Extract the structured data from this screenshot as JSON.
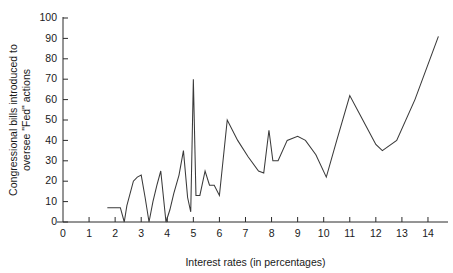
{
  "chart_data": {
    "type": "line",
    "title": "",
    "subtitle": "",
    "xlabel": "Interest rates (in percentages)",
    "ylabel": "Congressional bills introduced to oversee \"Fed\" actions",
    "ylabel_lines": [
      "Congressional bills introduced to",
      "oversee \"Fed\" actions"
    ],
    "xlim": [
      0,
      14.8
    ],
    "ylim": [
      0,
      100
    ],
    "xticks": [
      0,
      1,
      2,
      3,
      4,
      5,
      6,
      7,
      8,
      9,
      10,
      11,
      12,
      13,
      14
    ],
    "xtick_labels": [
      "0",
      "1",
      "2",
      "3",
      "4",
      "5",
      "6",
      "7",
      "8",
      "9",
      "10",
      "11",
      "12",
      "13",
      "14"
    ],
    "yticks": [
      0,
      10,
      20,
      30,
      40,
      50,
      60,
      70,
      80,
      90,
      100
    ],
    "ytick_labels": [
      "0",
      "10",
      "20",
      "30",
      "40",
      "50",
      "60",
      "70",
      "80",
      "90",
      "100"
    ],
    "grid": false,
    "legend": false,
    "legend_position": "none",
    "line_color": "#3a3a3a",
    "axis_color": "#2b2b2b",
    "background_color": "#ffffff",
    "series": [
      {
        "name": "Congressional bills",
        "x": [
          1.7,
          2.2,
          2.35,
          2.45,
          2.7,
          2.85,
          3.0,
          3.15,
          3.3,
          3.45,
          3.6,
          3.75,
          3.95,
          4.1,
          4.25,
          4.45,
          4.62,
          4.78,
          4.9,
          5.0,
          5.1,
          5.25,
          5.45,
          5.62,
          5.8,
          6.0,
          6.3,
          6.7,
          7.1,
          7.5,
          7.7,
          7.9,
          8.05,
          8.25,
          8.6,
          9.0,
          9.3,
          9.7,
          10.1,
          10.5,
          11.0,
          11.5,
          12.0,
          12.25,
          12.8,
          13.5,
          14.4
        ],
        "y": [
          7,
          7,
          0,
          8,
          20,
          22,
          23,
          12,
          0,
          10,
          18,
          25,
          0,
          6,
          14,
          23,
          35,
          12,
          5,
          70,
          13,
          13,
          25,
          18,
          18,
          13,
          50,
          40,
          32,
          25,
          24,
          45,
          30,
          30,
          40,
          42,
          40,
          33,
          22,
          40,
          62,
          50,
          38,
          35,
          40,
          60,
          91
        ]
      }
    ],
    "annotations": [
      {
        "label": "peak spike",
        "x": 5.0,
        "y": 70
      },
      {
        "label": "maximum endpoint",
        "x": 14.4,
        "y": 91
      }
    ]
  }
}
